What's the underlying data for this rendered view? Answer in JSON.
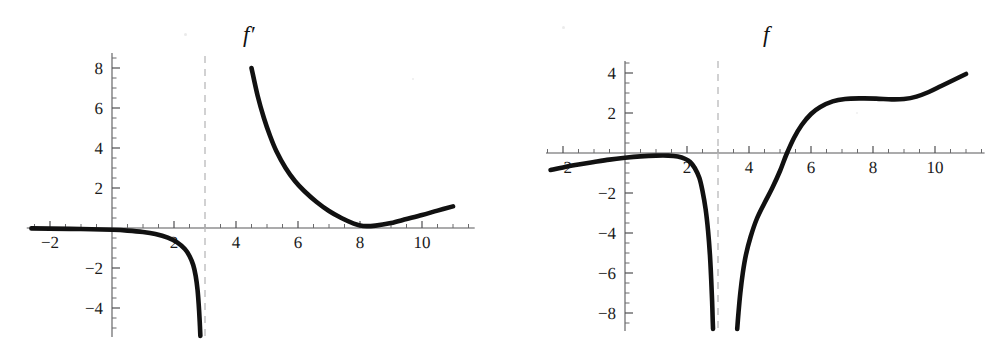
{
  "figure": {
    "background_color": "#ffffff",
    "curve_color": "#111111",
    "axis_color": "#58585a",
    "asymptote_color": "#b9b9bb",
    "panel_count": 2
  },
  "chart_data": [
    {
      "type": "line",
      "title": "f′",
      "xlabel": "",
      "ylabel": "",
      "xlim": [
        -2.6,
        11.6
      ],
      "ylim": [
        -5.4,
        8.6
      ],
      "grid": false,
      "legend": null,
      "xticks": [
        -2,
        2,
        4,
        6,
        8,
        10
      ],
      "xticklabels": [
        "-2",
        "2",
        "4",
        "6",
        "8",
        "10"
      ],
      "yticks": [
        8,
        6,
        4,
        2,
        -2,
        -4
      ],
      "yticklabels": [
        "8",
        "6",
        "4",
        "2",
        "-2",
        "-4"
      ],
      "minor_tick_step": 0.5,
      "annotations": [
        {
          "kind": "vertical-asymptote",
          "x": 3,
          "style": "dashed"
        }
      ],
      "series": [
        {
          "name": "f' left branch",
          "points": [
            [
              -2.6,
              -0.02
            ],
            [
              -2.0,
              -0.03
            ],
            [
              -1.0,
              -0.05
            ],
            [
              0.0,
              -0.09
            ],
            [
              0.5,
              -0.13
            ],
            [
              1.0,
              -0.2
            ],
            [
              1.4,
              -0.3
            ],
            [
              1.8,
              -0.48
            ],
            [
              2.1,
              -0.72
            ],
            [
              2.35,
              -1.05
            ],
            [
              2.5,
              -1.4
            ],
            [
              2.62,
              -1.85
            ],
            [
              2.7,
              -2.4
            ],
            [
              2.76,
              -3.1
            ],
            [
              2.8,
              -3.9
            ],
            [
              2.83,
              -4.7
            ],
            [
              2.85,
              -5.4
            ]
          ]
        },
        {
          "name": "f' right branch",
          "points": [
            [
              4.5,
              8.0
            ],
            [
              4.7,
              6.6
            ],
            [
              4.9,
              5.5
            ],
            [
              5.1,
              4.6
            ],
            [
              5.3,
              3.85
            ],
            [
              5.6,
              3.0
            ],
            [
              5.9,
              2.35
            ],
            [
              6.2,
              1.85
            ],
            [
              6.6,
              1.3
            ],
            [
              7.0,
              0.85
            ],
            [
              7.4,
              0.5
            ],
            [
              7.8,
              0.22
            ],
            [
              8.1,
              0.1
            ],
            [
              8.5,
              0.12
            ],
            [
              9.0,
              0.25
            ],
            [
              9.5,
              0.45
            ],
            [
              10.0,
              0.65
            ],
            [
              10.5,
              0.87
            ],
            [
              11.0,
              1.08
            ]
          ]
        }
      ]
    },
    {
      "type": "line",
      "title": "f",
      "xlabel": "",
      "ylabel": "",
      "xlim": [
        -2.4,
        11.6
      ],
      "ylim": [
        -8.8,
        4.6
      ],
      "grid": false,
      "legend": null,
      "xticks": [
        -2,
        2,
        4,
        6,
        8,
        10
      ],
      "xticklabels": [
        "-2",
        "2",
        "4",
        "6",
        "8",
        "10"
      ],
      "yticks": [
        4,
        2,
        -2,
        -4,
        -6,
        -8
      ],
      "yticklabels": [
        "4",
        "2",
        "-2",
        "-4",
        "-6",
        "-8"
      ],
      "minor_tick_step": 0.5,
      "annotations": [
        {
          "kind": "vertical-asymptote",
          "x": 3,
          "style": "dashed"
        }
      ],
      "series": [
        {
          "name": "f left branch",
          "points": [
            [
              -2.4,
              -0.85
            ],
            [
              -2.0,
              -0.72
            ],
            [
              -1.5,
              -0.58
            ],
            [
              -1.0,
              -0.45
            ],
            [
              -0.5,
              -0.33
            ],
            [
              0.0,
              -0.24
            ],
            [
              0.5,
              -0.17
            ],
            [
              1.0,
              -0.13
            ],
            [
              1.4,
              -0.13
            ],
            [
              1.7,
              -0.18
            ],
            [
              1.95,
              -0.3
            ],
            [
              2.1,
              -0.45
            ],
            [
              2.25,
              -0.75
            ],
            [
              2.4,
              -1.25
            ],
            [
              2.5,
              -1.9
            ],
            [
              2.6,
              -2.8
            ],
            [
              2.68,
              -3.9
            ],
            [
              2.74,
              -5.1
            ],
            [
              2.78,
              -6.3
            ],
            [
              2.81,
              -7.4
            ],
            [
              2.83,
              -8.4
            ],
            [
              2.84,
              -8.8
            ]
          ]
        },
        {
          "name": "f right branch",
          "points": [
            [
              3.62,
              -8.8
            ],
            [
              3.66,
              -8.0
            ],
            [
              3.72,
              -7.0
            ],
            [
              3.8,
              -6.0
            ],
            [
              3.9,
              -5.1
            ],
            [
              4.05,
              -4.2
            ],
            [
              4.25,
              -3.3
            ],
            [
              4.5,
              -2.5
            ],
            [
              4.75,
              -1.75
            ],
            [
              5.0,
              -0.9
            ],
            [
              5.2,
              -0.1
            ],
            [
              5.45,
              0.75
            ],
            [
              5.7,
              1.4
            ],
            [
              6.0,
              1.95
            ],
            [
              6.3,
              2.3
            ],
            [
              6.7,
              2.58
            ],
            [
              7.1,
              2.7
            ],
            [
              7.6,
              2.73
            ],
            [
              8.1,
              2.72
            ],
            [
              8.6,
              2.68
            ],
            [
              9.0,
              2.7
            ],
            [
              9.4,
              2.82
            ],
            [
              9.8,
              3.05
            ],
            [
              10.2,
              3.35
            ],
            [
              10.6,
              3.65
            ],
            [
              11.0,
              3.95
            ]
          ]
        }
      ]
    }
  ]
}
